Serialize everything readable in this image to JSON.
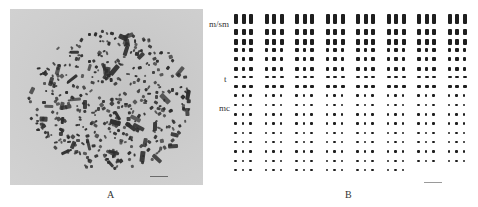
{
  "figure": {
    "panel_a": {
      "caption": "A",
      "description": "metaphase chromosome spread micrograph",
      "scale_bar": true
    },
    "panel_b": {
      "caption": "B",
      "description": "karyotype arranged in groups of three",
      "row_labels": [
        {
          "label": "m/sm",
          "row": 0
        },
        {
          "label": "t",
          "row": 5
        },
        {
          "label": "mc",
          "row": 8
        }
      ],
      "groups": 8,
      "chromosomes_per_group": 3,
      "rows": 17,
      "scale_bar": true
    }
  }
}
